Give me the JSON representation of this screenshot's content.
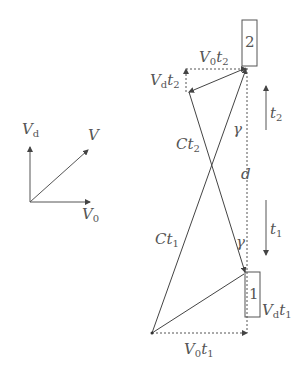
{
  "diagram": {
    "vector_legend": {
      "vd": {
        "main": "V",
        "sub": "d"
      },
      "v": {
        "main": "V",
        "sub": ""
      },
      "v0": {
        "main": "V",
        "sub": "0"
      }
    },
    "boxes": {
      "box2": "2",
      "box1": "1"
    },
    "labels": {
      "v0t2": {
        "main": "V",
        "sub": "0",
        "main2": "t",
        "sub2": "2"
      },
      "vdt2": {
        "main": "V",
        "sub": "d",
        "main2": "t",
        "sub2": "2"
      },
      "ct2": {
        "main": "Ct",
        "sub": "2"
      },
      "ct1": {
        "main": "Ct",
        "sub": "1"
      },
      "gamma_top": "γ",
      "gamma_bottom": "γ",
      "d": "d",
      "t2": {
        "main": "t",
        "sub": "2"
      },
      "t1": {
        "main": "t",
        "sub": "1"
      },
      "vdt1": {
        "main": "V",
        "sub": "d",
        "main2": "t",
        "sub2": "1"
      },
      "v0t1": {
        "main": "V",
        "sub": "0",
        "main2": "t",
        "sub2": "1"
      }
    },
    "line_color": "#555555"
  }
}
